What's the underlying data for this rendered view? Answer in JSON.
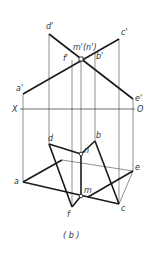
{
  "figure": {
    "caption": "( b )",
    "axis": {
      "left_label": "X",
      "right_label": "O"
    },
    "front_view_labels": {
      "d": "d'",
      "c": "c'",
      "a": "a'",
      "e": "e'",
      "f": "f'",
      "b": "b'",
      "mn": "m'(n')"
    },
    "top_view_labels": {
      "d": "d",
      "b": "b",
      "a": "a",
      "e": "e",
      "n": "n",
      "m": "m",
      "c": "c",
      "f": "f"
    },
    "colors": {
      "line": "#1a1a1a",
      "thin": "#333333",
      "text": "#333333"
    }
  }
}
